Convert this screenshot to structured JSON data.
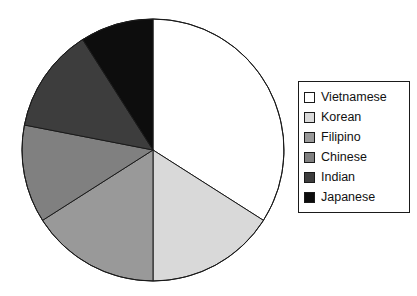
{
  "chart_data": {
    "type": "pie",
    "title": "",
    "subtitle": "",
    "xlabel": "",
    "ylabel": "",
    "grid": false,
    "legend_position": "right",
    "start_angle_deg": 0,
    "direction": "clockwise",
    "center": {
      "x": 153,
      "y": 150
    },
    "radius": 131,
    "categories": [
      "Vietnamese",
      "Korean",
      "Filipino",
      "Chinese",
      "Indian",
      "Japanese"
    ],
    "values": [
      34,
      16,
      16,
      12,
      13,
      9
    ],
    "colors": [
      "#ffffff",
      "#d9d9d9",
      "#999999",
      "#808080",
      "#3d3d3d",
      "#0d0d0d"
    ],
    "slice_angles_deg": [
      122.5,
      57.5,
      57.5,
      43.5,
      46.5,
      32.5
    ],
    "slice_boundaries_deg": [
      0,
      122.5,
      180,
      237.5,
      281,
      327.5,
      360
    ],
    "slices": [
      {
        "label": "Vietnamese",
        "value": 34,
        "color": "#ffffff",
        "start_deg": 0,
        "end_deg": 122.5
      },
      {
        "label": "Korean",
        "value": 16,
        "color": "#d9d9d9",
        "start_deg": 122.5,
        "end_deg": 180
      },
      {
        "label": "Filipino",
        "value": 16,
        "color": "#999999",
        "start_deg": 180,
        "end_deg": 237.5
      },
      {
        "label": "Chinese",
        "value": 12,
        "color": "#808080",
        "start_deg": 237.5,
        "end_deg": 281
      },
      {
        "label": "Indian",
        "value": 13,
        "color": "#3d3d3d",
        "start_deg": 281,
        "end_deg": 327.5
      },
      {
        "label": "Japanese",
        "value": 9,
        "color": "#0d0d0d",
        "start_deg": 327.5,
        "end_deg": 360
      }
    ],
    "annotations": [],
    "outline_color": "#1a1a1a"
  },
  "legend": {
    "border_color": "#1a1a1a",
    "items": [
      {
        "label": "Vietnamese",
        "color": "#ffffff"
      },
      {
        "label": "Korean",
        "color": "#d9d9d9"
      },
      {
        "label": "Filipino",
        "color": "#999999"
      },
      {
        "label": "Chinese",
        "color": "#808080"
      },
      {
        "label": "Indian",
        "color": "#3d3d3d"
      },
      {
        "label": "Japanese",
        "color": "#0d0d0d"
      }
    ]
  }
}
